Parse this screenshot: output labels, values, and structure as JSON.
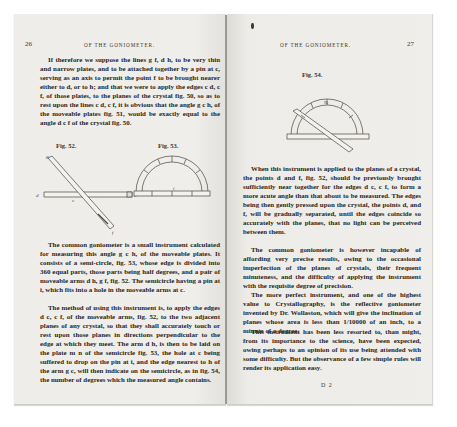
{
  "book": {
    "left_page": {
      "page_number": "26",
      "running_head": "OF THE GONIOMETER.",
      "paragraph_1": "If therefore we suppose the lines g f, d h, to be very thin and narrow plates, and to be attached together by a pin at c, serving as an axis to permit the point f to be brought nearer either to d, or to h; and that we were to apply the edges c d, c f, of those plates, to the planes of the crystal fig. 50, so as to rest upon the lines c d, c f, it is obvious that the angle g c h, of the moveable plates fig. 51, would be exactly equal to the angle d c f of the crystal fig. 50.",
      "figures": [
        {
          "label": "Fig. 52.",
          "points": [
            "g",
            "d",
            "c",
            "h",
            "f"
          ]
        },
        {
          "label": "Fig. 53.",
          "points": [
            "i"
          ]
        }
      ],
      "paragraph_2": "The common goniometer is a small instrument calculated for measuring this angle g c h, of the moveable plates. It consists of a semi-circle, fig. 53, whose edge is divided into 360 equal parts, those parts being half degrees, and a pair of moveable arms d h, g f, fig. 52. The semicircle having a pin at i, which fits into a hole in the moveable arms at c.",
      "paragraph_3": "The method of using this instrument is, to apply the edges d c, c f, of the moveable arms, fig. 52, to the two adjacent planes of any crystal, so that they shall accurately touch or rest upon those planes in directions perpendicular to the edge at which they meet. The arm d h, is then to be laid on the plate m n of the semicircle fig. 53, the hole at c being suffered to drop on the pin at i, and the edge nearest to h of the arm g c, will then indicate on the semicircle, as in fig. 54, the number of degrees which the measured angle contains."
    },
    "right_page": {
      "page_number": "27",
      "running_head": "OF THE GONIOMETER.",
      "figure": {
        "label": "Fig. 54.",
        "scale_mark": "90"
      },
      "paragraph_1": "When this instrument is applied to the planes of a crystal, the points d and f, fig. 52, should be previously brought sufficiently near together for the edges d c, c f, to form a more acute angle than that about to be measured. The edges being then gently pressed upon the crystal, the points d, and f, will be gradually separated, until the edges coincide so accurately with the planes, that no light can be perceived between them.",
      "paragraph_2": "The common goniometer is however incapable of affording very precise results, owing to the occasional imperfection of the planes of crystals, their frequent minuteness, and the difficulty of applying the instrument with the requisite degree of precision.",
      "paragraph_3": "The more perfect instrument, and one of the highest value to Crystallography, is the reflective goniometer invented by Dr. Wollaston, which will give the inclination of planes whose area is less than 1/10000 of an inch, to a minute of a degree.",
      "paragraph_4": "This instrument has been less resorted to, than might, from its importance to the science, have been expected, owing perhaps to an opinion of its use being attended with some difficulty. But the observance of a few simple rules will render its application easy.",
      "signature": "D 2"
    }
  }
}
